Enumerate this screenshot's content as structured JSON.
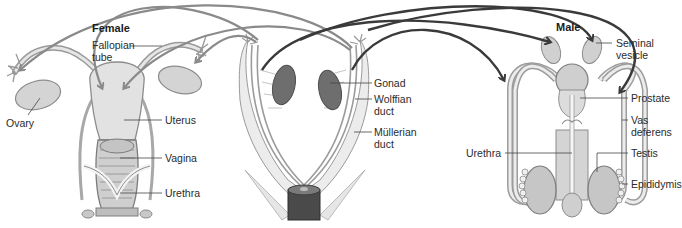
{
  "female": {
    "title": "Female",
    "labels": {
      "fallopian_tube": "Fallopian tube",
      "ovary": "Ovary",
      "uterus": "Uterus",
      "vagina": "Vagina",
      "urethra": "Urethra"
    }
  },
  "embryo": {
    "labels": {
      "gonad": "Gonad",
      "wolffian_duct": "Wolffian duct",
      "mullerian_duct": "Müllerian duct"
    }
  },
  "male": {
    "title": "Male",
    "labels": {
      "seminal_vesicle": "Seminal vesicle",
      "prostate": "Prostate",
      "vas_deferens": "Vas deferens",
      "urethra": "Urethra",
      "testis": "Testis",
      "epididymis": "Epididymis"
    }
  },
  "colors": {
    "female_arrow": "#8a8a8a",
    "male_arrow": "#3a3a3a",
    "organ_fill": "#dcdcdc",
    "organ_stroke": "#8c8c8c",
    "gonad_fill": "#6e6e6e"
  },
  "caption": ""
}
